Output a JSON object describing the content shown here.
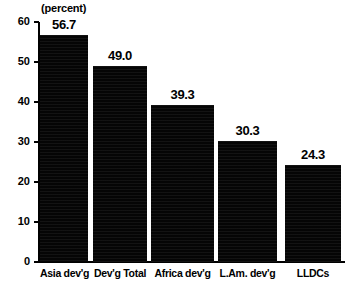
{
  "chart_data": {
    "type": "bar",
    "title": "",
    "subtitle": "",
    "xlabel": "",
    "ylabel": "(percent)",
    "unit_label": "(percent)",
    "categories": [
      "Asia dev'g",
      "Dev'g Total",
      "Africa dev'g",
      "L.Am. dev'g",
      "LLDCs"
    ],
    "values": [
      56.7,
      49.0,
      39.3,
      30.3,
      24.3
    ],
    "value_labels": [
      "56.7",
      "49.0",
      "39.3",
      "30.3",
      "24.3"
    ],
    "ylim": [
      0,
      60
    ],
    "ytick_values": [
      60,
      50,
      40,
      30,
      20,
      10,
      0
    ],
    "ytick_labels": [
      "60",
      "50",
      "40",
      "30",
      "20",
      "10",
      "0"
    ],
    "grid": false,
    "legend": null,
    "legend_position": "none",
    "bar_color": "#000000",
    "axis_color": "#000000",
    "background_color": "#ffffff"
  }
}
